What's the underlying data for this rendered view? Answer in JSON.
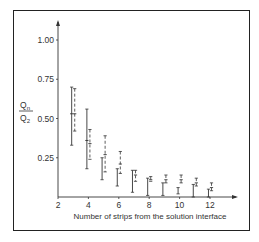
{
  "chart_data": {
    "type": "errorbar",
    "title": "",
    "xlabel": "Number of strips from the solution interface",
    "ylabel_numerator": "Q",
    "ylabel_numerator_sub": "n",
    "ylabel_denominator": "Q",
    "ylabel_denominator_sub": "2",
    "xlim": [
      2,
      13
    ],
    "ylim": [
      0,
      1.1
    ],
    "x_ticks": [
      2,
      4,
      6,
      8,
      10,
      12
    ],
    "x_tick_labels": [
      "2",
      "4",
      "6",
      "8",
      "10",
      "12"
    ],
    "y_ticks": [
      0.25,
      0.5,
      0.75,
      1.0
    ],
    "y_tick_labels": [
      "0.25",
      "0.50",
      "0.75",
      "1.00"
    ],
    "grid": false,
    "legend": null,
    "series": [
      {
        "name": "solid",
        "style": "solid",
        "x_offset": -0.1,
        "points": [
          {
            "x": 3,
            "low": 0.33,
            "mid": 0.53,
            "high": 0.7
          },
          {
            "x": 4,
            "low": 0.18,
            "mid": 0.36,
            "high": 0.56
          },
          {
            "x": 5,
            "low": 0.11,
            "mid": null,
            "high": 0.25
          },
          {
            "x": 6,
            "low": 0.07,
            "mid": null,
            "high": 0.18
          },
          {
            "x": 7,
            "low": 0.03,
            "mid": null,
            "high": 0.17
          },
          {
            "x": 8,
            "low": 0.01,
            "mid": null,
            "high": 0.12
          },
          {
            "x": 9,
            "low": 0.01,
            "mid": null,
            "high": 0.09
          },
          {
            "x": 10,
            "low": 0.02,
            "mid": null,
            "high": 0.06
          },
          {
            "x": 11,
            "low": 0.0,
            "mid": null,
            "high": 0.08
          },
          {
            "x": 12,
            "low": 0.0,
            "mid": null,
            "high": 0.05
          }
        ]
      },
      {
        "name": "dashed",
        "style": "dashed",
        "x_offset": 0.1,
        "points": [
          {
            "x": 3,
            "low": 0.42,
            "mid": 0.53,
            "high": 0.69
          },
          {
            "x": 4,
            "low": 0.24,
            "mid": 0.34,
            "high": 0.43
          },
          {
            "x": 5,
            "low": 0.16,
            "mid": 0.27,
            "high": 0.39
          },
          {
            "x": 6,
            "low": 0.15,
            "mid": 0.21,
            "high": 0.29
          },
          {
            "x": 7,
            "low": 0.1,
            "mid": 0.14,
            "high": 0.17
          },
          {
            "x": 8,
            "low": 0.1,
            "mid": 0.11,
            "high": 0.13
          },
          {
            "x": 9,
            "low": 0.09,
            "mid": 0.11,
            "high": 0.14
          },
          {
            "x": 10,
            "low": 0.09,
            "mid": 0.11,
            "high": 0.14
          },
          {
            "x": 11,
            "low": 0.07,
            "mid": 0.09,
            "high": 0.12
          },
          {
            "x": 12,
            "low": 0.04,
            "mid": 0.06,
            "high": 0.09
          }
        ]
      }
    ]
  }
}
